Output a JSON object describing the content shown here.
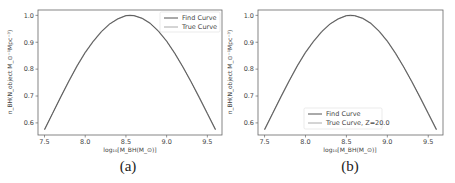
{
  "chart_data": [
    {
      "type": "line",
      "panel_label": "(a)",
      "title": "",
      "xlabel": "log10[M_BH(M_⊙)]",
      "ylabel": "n_BH(N_object M_⊙^-1 Mpc^-3)",
      "xlim": [
        7.42,
        9.68
      ],
      "ylim": [
        0.555,
        1.02
      ],
      "xticks": [
        7.5,
        8.0,
        8.5,
        9.0,
        9.5
      ],
      "xtick_labels": [
        "7.5",
        "8.0",
        "8.5",
        "9.0",
        "9.5"
      ],
      "yticks": [
        0.6,
        0.7,
        0.8,
        0.9,
        1.0
      ],
      "ytick_labels": [
        "0.6",
        "0.7",
        "0.8",
        "0.9",
        "1.0"
      ],
      "grid": false,
      "legend_position": "upper right",
      "x": [
        7.5,
        7.6,
        7.7,
        7.8,
        7.9,
        8.0,
        8.1,
        8.2,
        8.3,
        8.4,
        8.5,
        8.55,
        8.6,
        8.7,
        8.8,
        8.9,
        9.0,
        9.1,
        9.2,
        9.3,
        9.4,
        9.5,
        9.6
      ],
      "series": [
        {
          "name": "Find Curve",
          "color": "#555555",
          "values": [
            0.575,
            0.636,
            0.697,
            0.756,
            0.812,
            0.862,
            0.904,
            0.94,
            0.968,
            0.987,
            0.999,
            1.0,
            0.999,
            0.989,
            0.97,
            0.941,
            0.904,
            0.859,
            0.808,
            0.753,
            0.695,
            0.635,
            0.575
          ]
        },
        {
          "name": "True Curve",
          "color": "#aaaaaa",
          "values": [
            0.575,
            0.636,
            0.697,
            0.756,
            0.812,
            0.862,
            0.904,
            0.94,
            0.968,
            0.987,
            0.999,
            1.0,
            0.999,
            0.989,
            0.97,
            0.941,
            0.904,
            0.859,
            0.808,
            0.753,
            0.695,
            0.635,
            0.575
          ]
        }
      ]
    },
    {
      "type": "line",
      "panel_label": "(b)",
      "title": "",
      "xlabel": "log10[M_BH(M_⊙)]",
      "ylabel": "n_BH(N_object M_⊙^-1 Mpc^-3)",
      "xlim": [
        7.42,
        9.68
      ],
      "ylim": [
        0.555,
        1.02
      ],
      "xticks": [
        7.5,
        8.0,
        8.5,
        9.0,
        9.5
      ],
      "xtick_labels": [
        "7.5",
        "8.0",
        "8.5",
        "9.0",
        "9.5"
      ],
      "yticks": [
        0.6,
        0.7,
        0.8,
        0.9,
        1.0
      ],
      "ytick_labels": [
        "0.6",
        "0.7",
        "0.8",
        "0.9",
        "1.0"
      ],
      "grid": false,
      "legend_position": "lower center",
      "x": [
        7.5,
        7.6,
        7.7,
        7.8,
        7.9,
        8.0,
        8.1,
        8.2,
        8.3,
        8.4,
        8.5,
        8.55,
        8.6,
        8.7,
        8.8,
        8.9,
        9.0,
        9.1,
        9.2,
        9.3,
        9.4,
        9.5,
        9.6
      ],
      "series": [
        {
          "name": "Find Curve",
          "color": "#555555",
          "values": [
            0.575,
            0.636,
            0.697,
            0.756,
            0.812,
            0.862,
            0.904,
            0.94,
            0.968,
            0.987,
            0.999,
            1.0,
            0.999,
            0.989,
            0.97,
            0.941,
            0.904,
            0.859,
            0.808,
            0.753,
            0.695,
            0.635,
            0.575
          ]
        },
        {
          "name": "True Curve, Z=20.0",
          "color": "#aaaaaa",
          "values": [
            0.575,
            0.636,
            0.697,
            0.756,
            0.812,
            0.862,
            0.904,
            0.94,
            0.968,
            0.987,
            0.999,
            1.0,
            0.999,
            0.989,
            0.97,
            0.941,
            0.904,
            0.859,
            0.808,
            0.753,
            0.695,
            0.635,
            0.575
          ]
        }
      ]
    }
  ],
  "panels": [
    {
      "caption": "(a)",
      "legend": [
        "Find Curve",
        "True Curve"
      ],
      "xlabel_text": "log₁₀[M_BH(M_⊙)]",
      "ylabel_text": "n_BH(N_object M_⊙⁻¹Mpc⁻³)"
    },
    {
      "caption": "(b)",
      "legend": [
        "Find Curve",
        "True Curve, Z=20.0"
      ],
      "xlabel_text": "log₁₀[M_BH(M_⊙)]",
      "ylabel_text": "n_BH(N_object M_⊙⁻¹Mpc⁻³)"
    }
  ]
}
